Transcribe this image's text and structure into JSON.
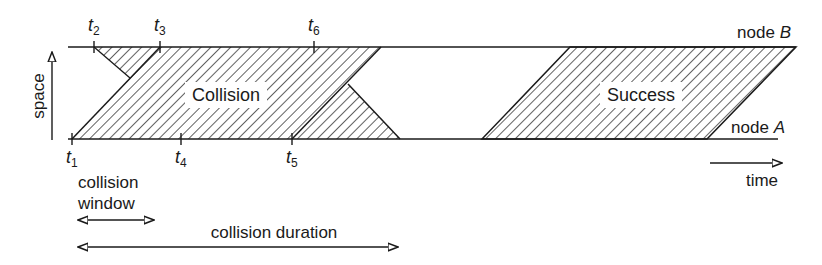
{
  "diagram": {
    "axes": {
      "space_label": "space",
      "time_label": "time"
    },
    "nodes": {
      "top": {
        "label": "node ",
        "name": "B"
      },
      "bottom": {
        "label": "node ",
        "name": "A"
      }
    },
    "regions": {
      "collision": "Collision",
      "success": "Success"
    },
    "time_marks": [
      {
        "t": "t",
        "sub": "1"
      },
      {
        "t": "t",
        "sub": "2"
      },
      {
        "t": "t",
        "sub": "3"
      },
      {
        "t": "t",
        "sub": "4"
      },
      {
        "t": "t",
        "sub": "5"
      },
      {
        "t": "t",
        "sub": "6"
      }
    ],
    "intervals": {
      "collision_window_line1": "collision",
      "collision_window_line2": "window",
      "collision_duration": "collision duration"
    },
    "colors": {
      "ink": "#1a1a1a",
      "hatch": "#3a3a3a",
      "background": "#ffffff"
    }
  }
}
